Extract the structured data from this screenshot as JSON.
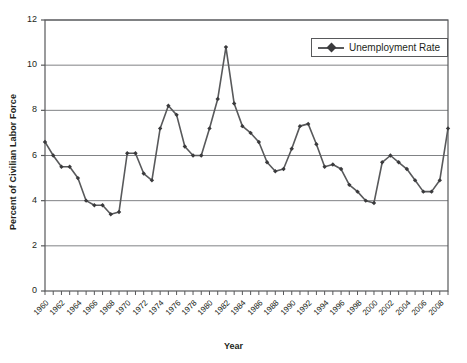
{
  "chart_data": {
    "type": "line",
    "title": "",
    "xlabel": "Year",
    "ylabel": "Percent of Civilian Labor Force",
    "xlim": [
      1960,
      2009
    ],
    "ylim": [
      0,
      12
    ],
    "yticks": [
      0,
      2,
      4,
      6,
      8,
      10,
      12
    ],
    "ytick_labels": [
      "0",
      "2",
      "4",
      "6",
      "8",
      "10",
      "12"
    ],
    "xtick_labels": [
      "1960",
      "1962",
      "1964",
      "1966",
      "1968",
      "1970",
      "1972",
      "1974",
      "1976",
      "1978",
      "1980",
      "1982",
      "1984",
      "1986",
      "1988",
      "1990",
      "1992",
      "1994",
      "1996",
      "1998",
      "2000",
      "2002",
      "2004",
      "2006",
      "2008"
    ],
    "xtick_step": 2,
    "minor_tick_step": 1,
    "grid": "horizontal",
    "legend_position": "top-right",
    "series": [
      {
        "name": "Unemployment Rate",
        "color": "#58595b",
        "marker": "diamond",
        "x": [
          1960,
          1961,
          1962,
          1963,
          1964,
          1965,
          1966,
          1967,
          1968,
          1969,
          1970,
          1971,
          1972,
          1973,
          1974,
          1975,
          1976,
          1977,
          1978,
          1979,
          1980,
          1981,
          1982,
          1983,
          1984,
          1985,
          1986,
          1987,
          1988,
          1989,
          1990,
          1991,
          1992,
          1993,
          1994,
          1995,
          1996,
          1997,
          1998,
          1999,
          2000,
          2001,
          2002,
          2003,
          2004,
          2005,
          2006,
          2007,
          2008,
          2009
        ],
        "values": [
          6.6,
          6.0,
          5.5,
          5.5,
          5.0,
          4.0,
          3.8,
          3.8,
          3.4,
          3.5,
          6.1,
          6.1,
          5.2,
          4.9,
          7.2,
          8.2,
          7.8,
          6.4,
          6.0,
          6.0,
          7.2,
          8.5,
          10.8,
          8.3,
          7.3,
          7.0,
          6.6,
          5.7,
          5.3,
          5.4,
          6.3,
          7.3,
          7.4,
          6.5,
          5.5,
          5.6,
          5.4,
          4.7,
          4.4,
          4.0,
          3.9,
          5.7,
          6.0,
          5.7,
          5.4,
          4.9,
          4.4,
          4.4,
          4.9,
          7.2
        ]
      }
    ]
  },
  "legend": {
    "entries": [
      {
        "label": "Unemployment Rate"
      }
    ]
  },
  "axes": {
    "x_title": "Year",
    "y_title": "Percent of Civilian Labor Force"
  }
}
